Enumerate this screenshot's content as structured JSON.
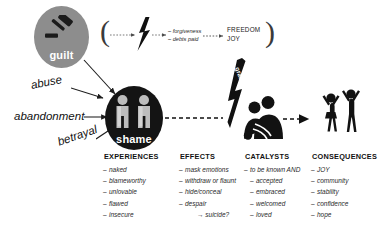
{
  "diagram": {
    "nodes": {
      "guilt": {
        "label": "guilt",
        "icon": "gavel-icon",
        "color": "#8d8d8d"
      },
      "shame": {
        "label": "shame",
        "icon": "two-figures-icon",
        "color": "#141414"
      },
      "bolt_small": {
        "icon": "lightning-bolt-icon"
      },
      "grace_bolt": {
        "label": "grace",
        "icon": "lightning-bolt-icon"
      },
      "embrace": {
        "icon": "embracing-figures-icon"
      },
      "celebration": {
        "icon": "celebrating-figures-icon"
      }
    },
    "guilt_branch": {
      "open_paren": "(",
      "close_paren": ")",
      "outcomes": [
        "– forgiveness",
        "– debts paid"
      ],
      "results": [
        "FREEDOM",
        "JOY"
      ]
    },
    "causes": [
      {
        "label": "abuse"
      },
      {
        "label": "abandonment"
      },
      {
        "label": "betrayal"
      }
    ],
    "columns": [
      {
        "heading": "EXPERIENCES",
        "items": [
          "naked",
          "blameworthy",
          "unlovable",
          "flawed",
          "insecure"
        ],
        "sub_items": []
      },
      {
        "heading": "EFFECTS",
        "items": [
          "mask emotions",
          "withdraw or flaunt",
          "hide/conceal",
          "despair"
        ],
        "sub_items": [
          "→ suicide?"
        ]
      },
      {
        "heading": "CATALYSTS",
        "items": [
          "to be known AND",
          "accepted",
          "embraced",
          "welcomed",
          "loved"
        ],
        "sub_items": []
      },
      {
        "heading": "CONSEQUENCES",
        "items": [
          "JOY",
          "community",
          "stability",
          "confidence",
          "hope"
        ],
        "sub_items": []
      }
    ],
    "bullet_dash": "–"
  }
}
